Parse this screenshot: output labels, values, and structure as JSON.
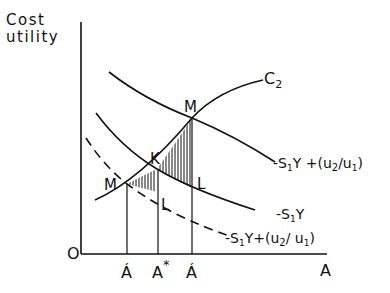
{
  "diagram": {
    "y_axis_label_line1": "Cost",
    "y_axis_label_line2": "utility",
    "x_axis_label": "A",
    "origin_label": "O",
    "curves": {
      "c2": "C",
      "c2_sub": "2",
      "upper_prefix": "-S",
      "upper_sub": "1",
      "upper_mid": "Y +(u",
      "upper_sub2": "2",
      "upper_mid2": "/u",
      "upper_sub3": "1",
      "upper_end": ")",
      "middle_prefix": "-S",
      "middle_sub": "1",
      "middle_end": "Y",
      "lower_prefix": "-S",
      "lower_sub": "1",
      "lower_mid": "Y+(u",
      "lower_sub2": "2",
      "lower_mid2": "/ u",
      "lower_sub3": "1",
      "lower_end": ")"
    },
    "points": {
      "m_left": "M",
      "m_right": "M",
      "k": "K",
      "l_left": "L",
      "l_right": "L"
    },
    "ticks": {
      "a_prime_left": "Á",
      "a_star": "A",
      "a_star_sup": "*",
      "a_prime_right": "Á"
    },
    "colors": {
      "ink": "#111111",
      "background": "#ffffff"
    }
  }
}
